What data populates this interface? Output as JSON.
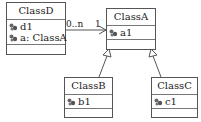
{
  "diagram": {
    "type": "UML class diagram",
    "classes": [
      {
        "id": "classD",
        "name": "ClassD",
        "attributes": [
          "d1",
          "a: ClassA"
        ]
      },
      {
        "id": "classA",
        "name": "ClassA",
        "attributes": [
          "a1"
        ]
      },
      {
        "id": "classB",
        "name": "ClassB",
        "attributes": [
          "b1"
        ]
      },
      {
        "id": "classC",
        "name": "ClassC",
        "attributes": [
          "c1"
        ]
      }
    ],
    "relationships": [
      {
        "type": "association",
        "from": "ClassD",
        "to": "ClassA",
        "source_multiplicity": "0..n",
        "target_multiplicity": "1",
        "navigable_to": "ClassA"
      },
      {
        "type": "generalization",
        "from": "ClassB",
        "to": "ClassA"
      },
      {
        "type": "generalization",
        "from": "ClassC",
        "to": "ClassA"
      }
    ],
    "attribute_icon": "attribute-icon",
    "colors": {
      "line": "#555555",
      "background": "#ffffff",
      "icon": "#666666"
    }
  }
}
